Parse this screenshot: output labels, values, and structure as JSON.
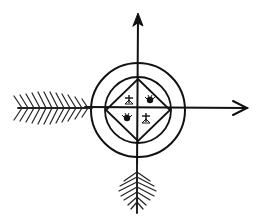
{
  "figure": {
    "title": "",
    "elements": [
      {
        "name": "outer-circle"
      },
      {
        "name": "inner-circle"
      },
      {
        "name": "diamond"
      },
      {
        "name": "vertical-axis-arrow-up"
      },
      {
        "name": "horizontal-axis-arrow-right"
      },
      {
        "name": "left-feather"
      },
      {
        "name": "bottom-feather"
      },
      {
        "name": "cross-symbol-top-left"
      },
      {
        "name": "sun-symbol-top-right"
      },
      {
        "name": "sun-symbol-bottom-left"
      },
      {
        "name": "cross-symbol-bottom-right"
      }
    ],
    "colors": {
      "ink": "#111111",
      "background": "#ffffff"
    }
  }
}
